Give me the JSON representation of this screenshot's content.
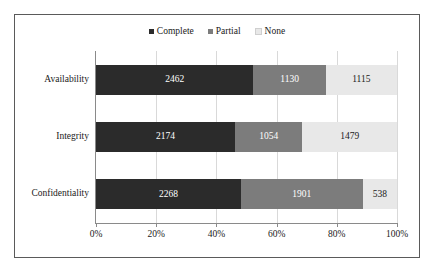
{
  "chart_data": {
    "type": "bar",
    "orientation": "horizontal",
    "stacked": true,
    "normalized": true,
    "title": "",
    "subtitle": "",
    "xlabel": "",
    "ylabel": "",
    "xlim": [
      0,
      100
    ],
    "xticks": [
      "0%",
      "20%",
      "40%",
      "60%",
      "80%",
      "100%"
    ],
    "xtick_values": [
      0,
      20,
      40,
      60,
      80,
      100
    ],
    "grid": true,
    "legend_position": "top-center",
    "categories": [
      "Availability",
      "Integrity",
      "Confidentiality"
    ],
    "series": [
      {
        "name": "Complete",
        "color": "#2b2b2b",
        "values": [
          2462,
          2174,
          2268
        ]
      },
      {
        "name": "Partial",
        "color": "#7c7c7c",
        "values": [
          1130,
          1054,
          1901
        ]
      },
      {
        "name": "None",
        "color": "#e8e8e8",
        "values": [
          1115,
          1479,
          538
        ]
      }
    ],
    "rows": [
      {
        "category": "Availability",
        "total": 4707,
        "segments": [
          {
            "series": "Complete",
            "value": 2462,
            "label": "2462",
            "percent": 52.31
          },
          {
            "series": "Partial",
            "value": 1130,
            "label": "1130",
            "percent": 24.01
          },
          {
            "series": "None",
            "value": 1115,
            "label": "1115",
            "percent": 23.69
          }
        ]
      },
      {
        "category": "Integrity",
        "total": 4707,
        "segments": [
          {
            "series": "Complete",
            "value": 2174,
            "label": "2174",
            "percent": 46.19
          },
          {
            "series": "Partial",
            "value": 1054,
            "label": "1054",
            "percent": 22.39
          },
          {
            "series": "None",
            "value": 1479,
            "label": "1479",
            "percent": 31.42
          }
        ]
      },
      {
        "category": "Confidentiality",
        "total": 4707,
        "segments": [
          {
            "series": "Complete",
            "value": 2268,
            "label": "2268",
            "percent": 48.18
          },
          {
            "series": "Partial",
            "value": 1901,
            "label": "1901",
            "percent": 40.39
          },
          {
            "series": "None",
            "value": 538,
            "label": "538",
            "percent": 11.43
          }
        ]
      }
    ]
  },
  "legend": {
    "items": [
      {
        "label": "Complete",
        "color": "#2b2b2b",
        "marker": "square-marker"
      },
      {
        "label": "Partial",
        "color": "#7c7c7c",
        "marker": "square-marker"
      },
      {
        "label": "None",
        "color": "#e8e8e8",
        "marker": "square-marker"
      }
    ]
  },
  "axis": {
    "x_ticks": [
      {
        "label": "0%",
        "value": 0
      },
      {
        "label": "20%",
        "value": 20
      },
      {
        "label": "40%",
        "value": 40
      },
      {
        "label": "60%",
        "value": 60
      },
      {
        "label": "80%",
        "value": 80
      },
      {
        "label": "100%",
        "value": 100
      }
    ]
  },
  "colors": {
    "complete": "#2b2b2b",
    "partial": "#7c7c7c",
    "none": "#e8e8e8",
    "gridline": "#d9d9d9",
    "axis": "#8a8a8a",
    "frame": "#5a5a5a",
    "background": "#ffffff",
    "text": "#1a1a1a"
  }
}
